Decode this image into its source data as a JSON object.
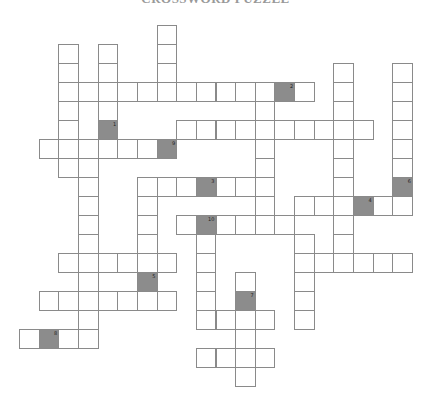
{
  "title": "CROSSWORD PUZZLE",
  "grid": {
    "origin_x": 19,
    "origin_y": 24.5,
    "cell_w": 19.65,
    "cell_h": 19.05,
    "border_color": "#8a8a8a",
    "marker_color": "#8c8c8c",
    "cells": [
      [
        7,
        0
      ],
      [
        7,
        1
      ],
      [
        7,
        2
      ],
      [
        2,
        1
      ],
      [
        2,
        2
      ],
      [
        2,
        4
      ],
      [
        2,
        5
      ],
      [
        2,
        7
      ],
      [
        4,
        1
      ],
      [
        4,
        2
      ],
      [
        4,
        4
      ],
      [
        2,
        3
      ],
      [
        3,
        3
      ],
      [
        4,
        3
      ],
      [
        5,
        3
      ],
      [
        6,
        3
      ],
      [
        7,
        3
      ],
      [
        8,
        3
      ],
      [
        9,
        3
      ],
      [
        10,
        3
      ],
      [
        11,
        3
      ],
      [
        12,
        3
      ],
      [
        14,
        3
      ],
      [
        12,
        4
      ],
      [
        12,
        6
      ],
      [
        12,
        7
      ],
      [
        12,
        9
      ],
      [
        16,
        2
      ],
      [
        16,
        3
      ],
      [
        16,
        4
      ],
      [
        16,
        6
      ],
      [
        16,
        7
      ],
      [
        16,
        8
      ],
      [
        16,
        10
      ],
      [
        16,
        11
      ],
      [
        19,
        2
      ],
      [
        19,
        3
      ],
      [
        19,
        4
      ],
      [
        19,
        5
      ],
      [
        19,
        6
      ],
      [
        19,
        7
      ],
      [
        8,
        5
      ],
      [
        9,
        5
      ],
      [
        10,
        5
      ],
      [
        11,
        5
      ],
      [
        12,
        5
      ],
      [
        13,
        5
      ],
      [
        14,
        5
      ],
      [
        15,
        5
      ],
      [
        16,
        5
      ],
      [
        17,
        5
      ],
      [
        1,
        6
      ],
      [
        2,
        6
      ],
      [
        3,
        6
      ],
      [
        4,
        6
      ],
      [
        5,
        6
      ],
      [
        6,
        6
      ],
      [
        3,
        7
      ],
      [
        3,
        8
      ],
      [
        3,
        9
      ],
      [
        3,
        10
      ],
      [
        3,
        11
      ],
      [
        3,
        13
      ],
      [
        3,
        15
      ],
      [
        6,
        8
      ],
      [
        7,
        8
      ],
      [
        8,
        8
      ],
      [
        10,
        8
      ],
      [
        11,
        8
      ],
      [
        12,
        8
      ],
      [
        6,
        9
      ],
      [
        6,
        10
      ],
      [
        6,
        11
      ],
      [
        14,
        9
      ],
      [
        15,
        9
      ],
      [
        16,
        9
      ],
      [
        18,
        9
      ],
      [
        19,
        9
      ],
      [
        8,
        10
      ],
      [
        10,
        10
      ],
      [
        11,
        10
      ],
      [
        12,
        10
      ],
      [
        13,
        10
      ],
      [
        9,
        11
      ],
      [
        9,
        12
      ],
      [
        9,
        13
      ],
      [
        9,
        14
      ],
      [
        14,
        11
      ],
      [
        14,
        13
      ],
      [
        14,
        14
      ],
      [
        14,
        15
      ],
      [
        2,
        12
      ],
      [
        3,
        12
      ],
      [
        4,
        12
      ],
      [
        5,
        12
      ],
      [
        6,
        12
      ],
      [
        7,
        12
      ],
      [
        14,
        12
      ],
      [
        15,
        12
      ],
      [
        16,
        12
      ],
      [
        17,
        12
      ],
      [
        18,
        12
      ],
      [
        19,
        12
      ],
      [
        1,
        14
      ],
      [
        2,
        14
      ],
      [
        3,
        14
      ],
      [
        4,
        14
      ],
      [
        5,
        14
      ],
      [
        6,
        14
      ],
      [
        7,
        14
      ],
      [
        11,
        13
      ],
      [
        11,
        16
      ],
      [
        11,
        18
      ],
      [
        9,
        15
      ],
      [
        10,
        15
      ],
      [
        11,
        15
      ],
      [
        12,
        15
      ],
      [
        0,
        16
      ],
      [
        2,
        16
      ],
      [
        3,
        16
      ],
      [
        9,
        17
      ],
      [
        10,
        17
      ],
      [
        11,
        17
      ],
      [
        12,
        17
      ]
    ],
    "markers": [
      {
        "col": 4,
        "row": 5,
        "number": "1"
      },
      {
        "col": 13,
        "row": 3,
        "number": "2"
      },
      {
        "col": 9,
        "row": 8,
        "number": "3"
      },
      {
        "col": 17,
        "row": 9,
        "number": "4"
      },
      {
        "col": 6,
        "row": 13,
        "number": "5"
      },
      {
        "col": 19,
        "row": 8,
        "number": "6"
      },
      {
        "col": 11,
        "row": 14,
        "number": "7"
      },
      {
        "col": 1,
        "row": 16,
        "number": "8"
      },
      {
        "col": 7,
        "row": 6,
        "number": "9"
      },
      {
        "col": 9,
        "row": 10,
        "number": "10"
      }
    ]
  }
}
